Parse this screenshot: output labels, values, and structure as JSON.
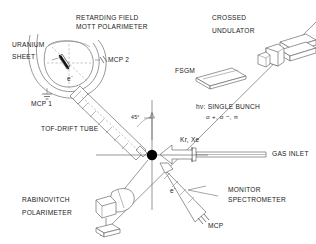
{
  "figure": {
    "type": "apparatus-schematic",
    "background_color": "#ffffff",
    "line_color": "#555555",
    "text_color": "#1a1a1a",
    "interaction_point_color": "#000000"
  },
  "labels": {
    "mott_polarimeter_line1": "RETARDING FIELD",
    "mott_polarimeter_line2": "MOTT POLARIMETER",
    "uranium_line1": "URANIUM",
    "uranium_line2": "SHEET",
    "mcp2": "MCP 2",
    "mcp1": "MCP 1",
    "electron_hemisphere": "e",
    "electron_hemisphere_charge": "-",
    "crossed_line1": "CROSSED",
    "crossed_line2": "UNDULATOR",
    "fsgm": "FSGM",
    "beam_line1": "hν: SINGLE BUNCH",
    "beam_line2_a": "σ",
    "beam_line2_b": "σ",
    "beam_line2_c": ", π",
    "beam_polarizations": "σ +, σ −, π",
    "gas_species": "Kr, Xe",
    "gas_inlet": "GAS INLET",
    "monitor_line1": "MONITOR",
    "monitor_line2": "SPECTROMETER",
    "monitor_electron": "e",
    "monitor_electron_charge": "-",
    "monitor_mcp": "MCP",
    "tof_drift_tube": "TOF-DRIFT TUBE",
    "angle_45": "45",
    "angle_unit": "°",
    "rabinovitch_line1": "RABINOVITCH",
    "rabinovitch_line2": "POLARIMETER"
  },
  "components": [
    {
      "name": "retarding-field-mott-polarimeter",
      "label": "RETARDING FIELD MOTT POLARIMETER",
      "position": "upper-left"
    },
    {
      "name": "uranium-sheet",
      "label": "URANIUM SHEET",
      "position": "left"
    },
    {
      "name": "mcp-2-detector",
      "label": "MCP 2",
      "position": "upper-left"
    },
    {
      "name": "mcp-1-detector",
      "label": "MCP 1",
      "position": "left"
    },
    {
      "name": "crossed-undulator",
      "label": "CROSSED UNDULATOR",
      "position": "upper-right"
    },
    {
      "name": "fsgm-grating",
      "label": "FSGM",
      "position": "upper-right"
    },
    {
      "name": "photon-beam",
      "label": "hν: SINGLE BUNCH",
      "position": "diagonal"
    },
    {
      "name": "gas-inlet",
      "label": "GAS INLET",
      "position": "right"
    },
    {
      "name": "monitor-spectrometer",
      "label": "MONITOR SPECTROMETER",
      "position": "lower-right"
    },
    {
      "name": "tof-drift-tube",
      "label": "TOF-DRIFT TUBE",
      "position": "center-left"
    },
    {
      "name": "rabinovitch-polarimeter",
      "label": "RABINOVITCH POLARIMETER",
      "position": "lower-left"
    },
    {
      "name": "interaction-point",
      "label": "",
      "position": "center"
    }
  ]
}
